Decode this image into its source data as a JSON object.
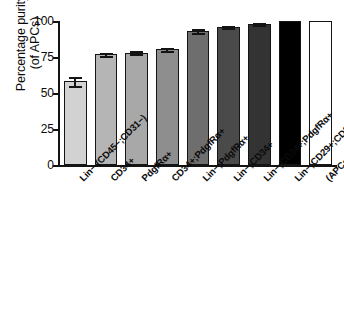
{
  "chart_data": {
    "type": "bar",
    "title": "",
    "xlabel": "",
    "ylabel": "Percentage purity (of APCs)",
    "ylabel_line1": "Percentage purity",
    "ylabel_line2": "(of APCs)",
    "ylim": [
      0,
      100
    ],
    "yticks": [
      0,
      25,
      50,
      75,
      100
    ],
    "ytick_labels": [
      "0",
      "25",
      "50",
      "75",
      "100"
    ],
    "grid": false,
    "legend": false,
    "categories": [
      "Lin− (CD45−;CD31−)",
      "CD34+",
      "PdgfRα+",
      "CD34+;PdgfRα+",
      "Lin−;PdgfRα+",
      "Lin−;CD34+",
      "Lin−;CD34+;PdgfRα+",
      "Lin−;CD29+;CD34+;Sca+",
      "(APCs) Lin−;CD29+;CD34+;Sca1+;PdgfRα+"
    ],
    "values": [
      58,
      77,
      78,
      80.5,
      93,
      96,
      98,
      100,
      100
    ],
    "errors": [
      3.2,
      1.0,
      1.0,
      1.0,
      1.1,
      0.8,
      0.5,
      0,
      0
    ],
    "bar_colors": [
      "#d2d2d2",
      "#b5b5b5",
      "#a8a8a8",
      "#8e8e8e",
      "#6e6e6e",
      "#4a4a4a",
      "#333333",
      "#000000",
      "#ffffff"
    ],
    "bar_edge_color": "#141414"
  }
}
